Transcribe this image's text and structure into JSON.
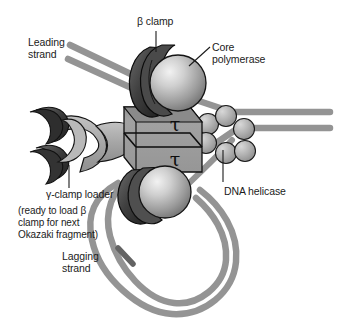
{
  "figure": {
    "type": "biological-schematic",
    "background_color": "#ffffff"
  },
  "colors": {
    "dna_strand": "#949494",
    "dna_strand_dark": "#6f6f6f",
    "box_fill": "#9b9b9b",
    "box_top_band": "#7c7c7c",
    "clamp_dark": "#3c3c3c",
    "clamp_mid": "#565656",
    "sphere_light": "#dcdcdc",
    "sphere_mid": "#8e8e8e",
    "helicase_fill": "#b3b3b3",
    "loader_fill": "#a8a8a8",
    "outline": "#111111",
    "text": "#1b1b1b"
  },
  "labels": {
    "beta_clamp": "β clamp",
    "core_polymerase_line1": "Core",
    "core_polymerase_line2": "polymerase",
    "leading_strand_line1": "Leading",
    "leading_strand_line2": "strand",
    "lagging_strand_line1": "Lagging",
    "lagging_strand_line2": "strand",
    "dna_helicase": "DNA helicase",
    "gamma_clamp_loader": "γ-clamp loader",
    "note_line1": "(ready to load β",
    "note_line2": "clamp for next",
    "note_line3": "Okazaki fragment)"
  },
  "subunits": {
    "tau_upper": "τ",
    "tau_lower": "τ"
  },
  "components": {
    "helicase_subunit_count": 6,
    "core_polymerase_count": 2,
    "beta_clamp_count": 2,
    "tau_subunit_count": 2,
    "parental_duplex_strands": 2,
    "leading_strand_strands": 2
  }
}
